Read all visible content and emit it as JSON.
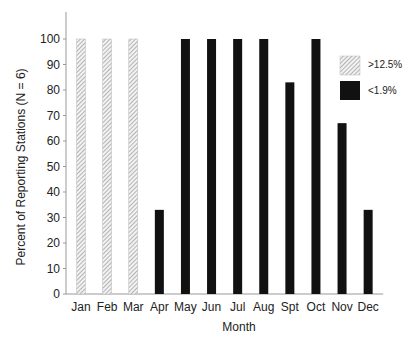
{
  "chart_data": {
    "type": "bar",
    "title": "",
    "xlabel": "Month",
    "ylabel": "Percent of Reporting Stations (N = 6)",
    "ylim": [
      0,
      100
    ],
    "yticks": [
      0,
      10,
      20,
      30,
      40,
      50,
      60,
      70,
      80,
      90,
      100
    ],
    "grid": false,
    "legend_position": "upper right",
    "categories": [
      "Jan",
      "Feb",
      "Mar",
      "Apr",
      "May",
      "Jun",
      "Jul",
      "Aug",
      "Spt",
      "Oct",
      "Nov",
      "Dec"
    ],
    "series": [
      {
        "name": ">12.5%",
        "style": "hatched",
        "color": "#cccccc",
        "values": [
          100,
          100,
          100,
          0,
          0,
          0,
          0,
          0,
          0,
          0,
          0,
          0
        ]
      },
      {
        "name": "<1.9%",
        "style": "solid",
        "color": "#111111",
        "values": [
          0,
          0,
          0,
          33,
          100,
          100,
          100,
          100,
          83,
          100,
          67,
          33
        ]
      }
    ]
  },
  "legend": {
    "items": [
      {
        "label": ">12.5%",
        "style": "hatched"
      },
      {
        "label": "<1.9%",
        "style": "solid"
      }
    ]
  }
}
